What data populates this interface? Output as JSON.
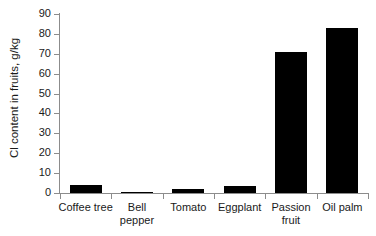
{
  "chart_data": {
    "type": "bar",
    "title": "",
    "subtitle": "",
    "xlabel": "",
    "ylabel": "Cl content in fruits, g/kg",
    "categories": [
      "Coffee tree",
      "Bell pepper",
      "Tomato",
      "Eggplant",
      "Passion fruit",
      "Oil palm"
    ],
    "category_lines": [
      [
        "Coffee tree"
      ],
      [
        "Bell",
        "pepper"
      ],
      [
        "Tomato"
      ],
      [
        "Eggplant"
      ],
      [
        "Passion",
        "fruit"
      ],
      [
        "Oil palm"
      ]
    ],
    "values": [
      4.1,
      0.5,
      2.1,
      3.6,
      71,
      83
    ],
    "ylim": [
      0,
      90
    ],
    "ytick_labels": [
      "90",
      "80",
      "70",
      "60",
      "50",
      "40",
      "30",
      "20",
      "10",
      "0"
    ],
    "ytick_values": [
      90,
      80,
      70,
      60,
      50,
      40,
      30,
      20,
      10,
      0
    ],
    "ytick_step": 10,
    "grid": false,
    "legend": false,
    "legend_position": "none",
    "bar_color": "#000000",
    "axis_color": "#8c8c8c",
    "text_color": "#1a1a1a",
    "background_color": "#ffffff"
  }
}
